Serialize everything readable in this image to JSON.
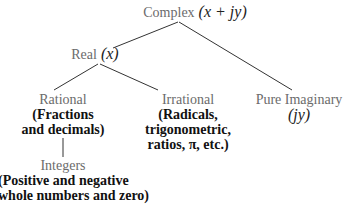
{
  "diagram": {
    "type": "tree",
    "colors": {
      "line": "#333333",
      "title_text": "#6b6b6b",
      "desc_text": "#111111"
    },
    "nodes": {
      "complex": {
        "label": "Complex",
        "expr": "(x + jy)"
      },
      "real": {
        "label": "Real",
        "expr": "(x)"
      },
      "rational": {
        "label": "Rational",
        "desc_line1": "(Fractions",
        "desc_line2": "and decimals)"
      },
      "irrational": {
        "label": "Irrational",
        "desc_line1": "(Radicals,",
        "desc_line2": "trigonometric,",
        "desc_line3": "ratios, π, etc.)"
      },
      "pure_imaginary": {
        "label": "Pure Imaginary",
        "expr": "(jy)"
      },
      "integers": {
        "label": "Integers",
        "desc_line1": "(Positive and negative",
        "desc_line2": "whole numbers and zero)"
      }
    },
    "edges": [
      [
        "complex",
        "real"
      ],
      [
        "complex",
        "pure_imaginary"
      ],
      [
        "real",
        "rational"
      ],
      [
        "real",
        "irrational"
      ],
      [
        "rational",
        "integers"
      ]
    ]
  }
}
